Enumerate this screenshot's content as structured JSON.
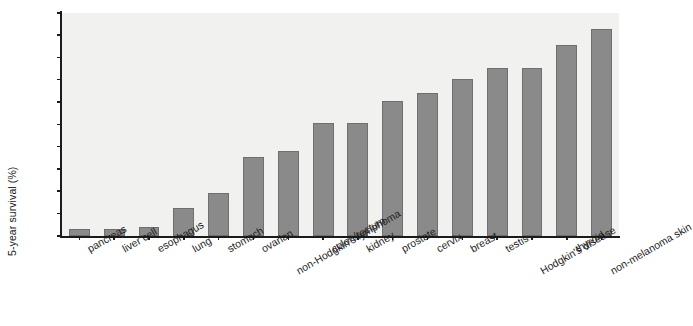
{
  "chart_data": {
    "type": "bar",
    "title": "",
    "xlabel": "",
    "ylabel": "5-year survival (%)",
    "ylim": [
      0,
      100
    ],
    "ytick_step": 10,
    "yticks": [
      "0",
      "10",
      "20",
      "30",
      "40",
      "50",
      "60",
      "70",
      "80",
      "90",
      "100"
    ],
    "grid": false,
    "legend": "none",
    "bar_color": "#8a8a8a",
    "plot_background": "#f1f1ef",
    "axis_color": "#1b1b1b",
    "categories": [
      "pancreas",
      "liver cell",
      "esophagus",
      "lung",
      "stomach",
      "ovarian",
      "non-Hodgkin's lymphoma",
      "colon/rectum",
      "kidney",
      "prostate",
      "cervix",
      "breast",
      "testis",
      "Hodgkin's disease",
      "thyroid",
      "non-melanoma skin"
    ],
    "values": [
      3,
      3,
      4,
      12.5,
      19.5,
      35.5,
      38,
      50.5,
      50.5,
      60.5,
      64,
      70.5,
      75.5,
      75.5,
      85.5,
      93
    ]
  }
}
